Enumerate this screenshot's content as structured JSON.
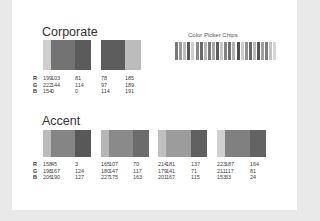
{
  "sections": {
    "corporate": {
      "title": "Corporate",
      "groups": [
        {
          "colors": [
            {
              "r": 199,
              "g": 222,
              "b": 154
            },
            {
              "r": 103,
              "g": 144,
              "b": 0
            },
            {
              "r": 81,
              "g": 114,
              "b": 0
            }
          ]
        },
        {
          "colors": [
            {
              "r": 78,
              "g": 97,
              "b": 114
            },
            {
              "r": 185,
              "g": 189,
              "b": 191
            }
          ]
        }
      ]
    },
    "accent": {
      "title": "Accent",
      "groups": [
        {
          "colors": [
            {
              "r": 158,
              "g": 198,
              "b": 206
            },
            {
              "r": 45,
              "g": 167,
              "b": 190
            },
            {
              "r": 3,
              "g": 124,
              "b": 127
            }
          ]
        },
        {
          "colors": [
            {
              "r": 165,
              "g": 180,
              "b": 227
            },
            {
              "r": 107,
              "g": 147,
              "b": 175
            },
            {
              "r": 70,
              "g": 117,
              "b": 163
            }
          ]
        },
        {
          "colors": [
            {
              "r": 214,
              "g": 179,
              "b": 201
            },
            {
              "r": 181,
              "g": 141,
              "b": 167
            },
            {
              "r": 137,
              "g": 71,
              "b": 115
            }
          ]
        },
        {
          "colors": [
            {
              "r": 223,
              "g": 211,
              "b": 153
            },
            {
              "r": 187,
              "g": 117,
              "b": 33
            },
            {
              "r": 164,
              "g": 81,
              "b": 24
            }
          ]
        }
      ]
    }
  },
  "row_labels": [
    "R",
    "G",
    "B"
  ],
  "chips": {
    "title": "Color Picker Chips",
    "shades": [
      "#7a7a7a",
      "#9a9a9a",
      "#bdbdbd",
      "#585858",
      "#cfcfcf",
      "#8a8a8a",
      "#6a6a6a",
      "#b5b5b5",
      "#777777",
      "#a6a6a6",
      "#5c5c5c",
      "#c7c7c7",
      "#838383",
      "#6f6f6f",
      "#b0b0b0",
      "#4f4f4f",
      "#cccccc",
      "#909090",
      "#666666",
      "#bababa",
      "#535353",
      "#a0a0a0",
      "#7e7e7e",
      "#c2c2c2",
      "#d6d6d6"
    ]
  }
}
